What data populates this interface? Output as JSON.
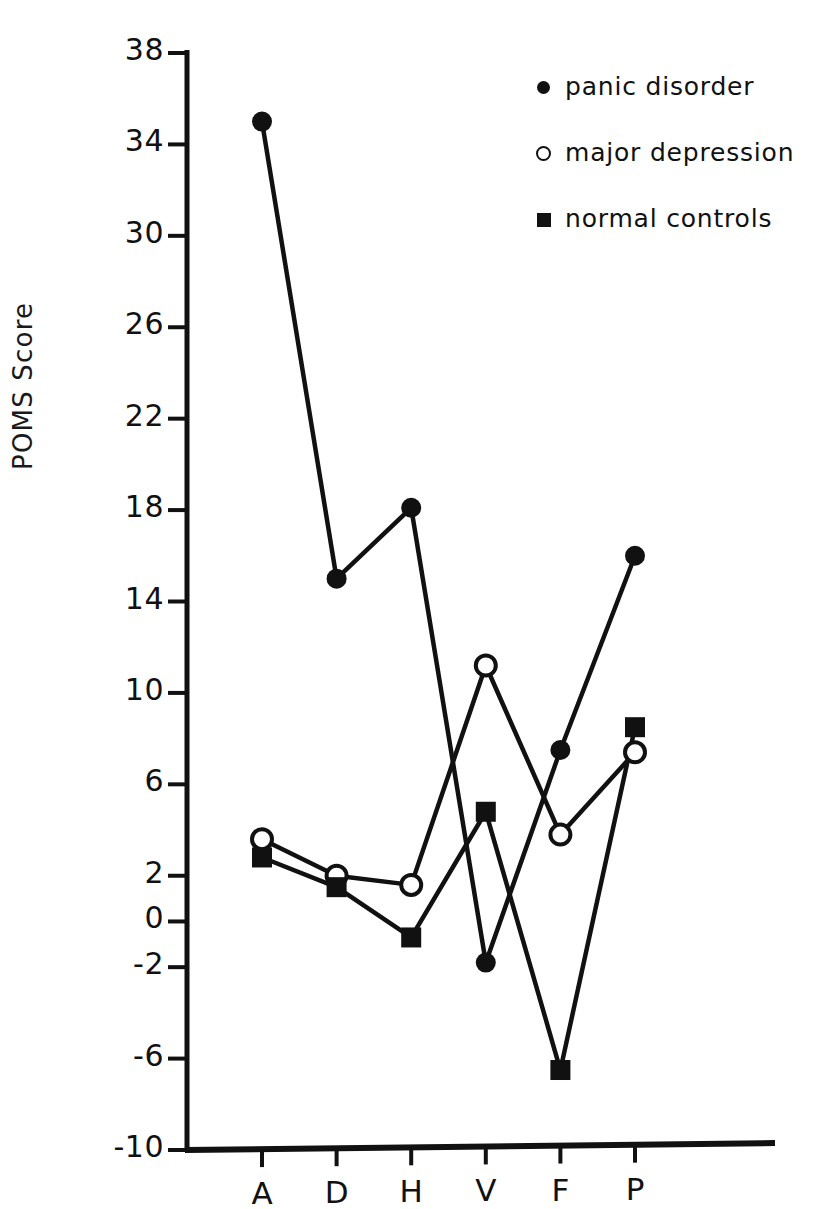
{
  "figure": {
    "ylabel": "POMS Score",
    "yticks": [
      "38",
      "34",
      "30",
      "26",
      "22",
      "18",
      "14",
      "10",
      "6",
      "2",
      "0",
      "-2",
      "-6",
      "-10"
    ],
    "xticks": [
      "A",
      "D",
      "H",
      "V",
      "F",
      "P"
    ]
  },
  "legend": {
    "entries": [
      {
        "label": "panic disorder",
        "marker": "filled-circle",
        "color": "#111111"
      },
      {
        "label": "major depression",
        "marker": "open-circle",
        "color": "#111111"
      },
      {
        "label": "normal controls",
        "marker": "filled-square",
        "color": "#111111"
      }
    ]
  },
  "chart_data": {
    "type": "line",
    "title": "",
    "xlabel": "",
    "ylabel": "POMS Score",
    "categories": [
      "A",
      "D",
      "H",
      "V",
      "F",
      "P"
    ],
    "ylim": [
      -10,
      38
    ],
    "ytick_values": [
      38,
      34,
      30,
      26,
      22,
      18,
      14,
      10,
      6,
      2,
      0,
      -2,
      -6,
      -10
    ],
    "grid": false,
    "legend_position": "top-right",
    "series": [
      {
        "name": "panic disorder",
        "marker": "filled-circle",
        "values": [
          35.0,
          15.0,
          18.1,
          -1.8,
          7.5,
          16.0
        ]
      },
      {
        "name": "major depression",
        "marker": "open-circle",
        "values": [
          3.6,
          2.0,
          1.6,
          11.2,
          3.8,
          7.4
        ]
      },
      {
        "name": "normal controls",
        "marker": "filled-square",
        "values": [
          2.8,
          1.5,
          -0.7,
          4.8,
          -6.5,
          8.5
        ]
      }
    ]
  }
}
